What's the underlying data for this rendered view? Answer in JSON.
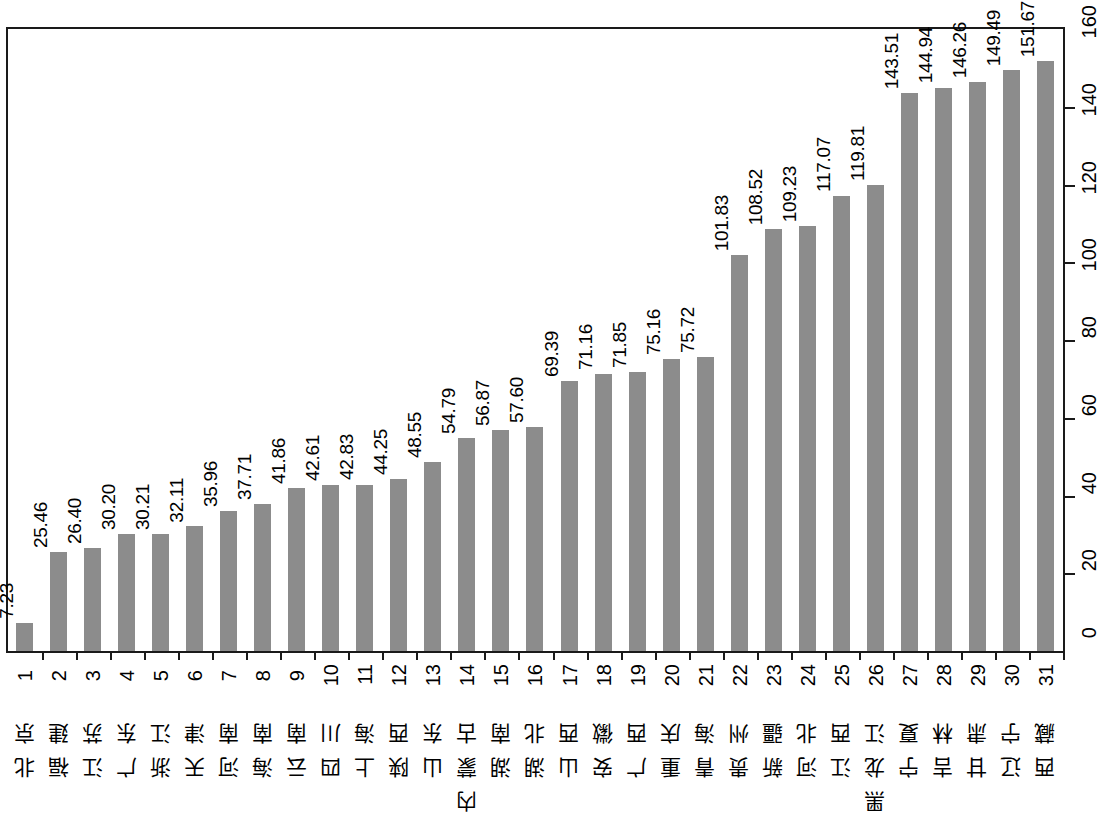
{
  "chart_data": {
    "type": "bar",
    "title": "",
    "xlabel": "",
    "ylabel": "",
    "ylim": [
      0,
      160
    ],
    "yticks": [
      0,
      20,
      40,
      60,
      80,
      100,
      120,
      140,
      160
    ],
    "grid": false,
    "legend": null,
    "y_axis_position": "right",
    "bar_color": "#8c8c8c",
    "value_label_precision": 2,
    "index": [
      1,
      2,
      3,
      4,
      5,
      6,
      7,
      8,
      9,
      10,
      11,
      12,
      13,
      14,
      15,
      16,
      17,
      18,
      19,
      20,
      21,
      22,
      23,
      24,
      25,
      26,
      27,
      28,
      29,
      30,
      31
    ],
    "categories": [
      "北京",
      "福建",
      "江苏",
      "广东",
      "浙江",
      "天津",
      "河南",
      "海南",
      "云南",
      "四川",
      "上海",
      "陕西",
      "山东",
      "内蒙古",
      "湖南",
      "湖北",
      "山西",
      "安徽",
      "广西",
      "重庆",
      "青海",
      "贵州",
      "新疆",
      "河北",
      "江西",
      "黑龙江",
      "宁夏",
      "吉林",
      "甘肃",
      "辽宁",
      "西藏"
    ],
    "values": [
      7.23,
      25.46,
      26.4,
      30.2,
      30.21,
      32.11,
      35.96,
      37.71,
      41.86,
      42.61,
      42.83,
      44.25,
      48.55,
      54.79,
      56.87,
      57.6,
      69.39,
      71.16,
      71.85,
      75.16,
      75.72,
      101.83,
      108.52,
      109.23,
      117.07,
      119.81,
      143.51,
      144.94,
      146.26,
      149.49,
      151.67
    ],
    "value_labels": [
      "7.23",
      "25.46",
      "26.40",
      "30.20",
      "30.21",
      "32.11",
      "35.96",
      "37.71",
      "41.86",
      "42.61",
      "42.83",
      "44.25",
      "48.55",
      "54.79",
      "56.87",
      "57.60",
      "69.39",
      "71.16",
      "71.85",
      "75.16",
      "75.72",
      "101.83",
      "108.52",
      "109.23",
      "117.07",
      "119.81",
      "143.51",
      "144.94",
      "146.26",
      "149.49",
      "151.67"
    ],
    "ytick_labels": [
      "0",
      "20",
      "40",
      "60",
      "80",
      "100",
      "120",
      "140",
      "160"
    ]
  }
}
